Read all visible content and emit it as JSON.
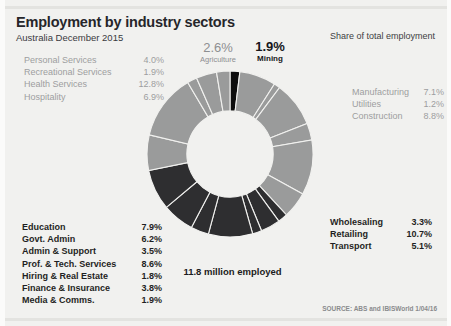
{
  "header": {
    "title": "Employment by industry sectors",
    "subtitle": "Australia December 2015",
    "share_header": "Share of total employment"
  },
  "labels_top_left": [
    {
      "name": "Personal Services",
      "value": "4.0%"
    },
    {
      "name": "Recreational Services",
      "value": "1.9%"
    },
    {
      "name": "Health Services",
      "value": "12.8%"
    },
    {
      "name": "Hospitality",
      "value": "6.9%"
    }
  ],
  "labels_bottom_left": [
    {
      "name": "Education",
      "value": "7.9%"
    },
    {
      "name": "Govt. Admin",
      "value": "6.2%"
    },
    {
      "name": "Admin & Support",
      "value": "3.5%"
    },
    {
      "name": "Prof. & Tech. Services",
      "value": "8.6%"
    },
    {
      "name": "Hiring & Real Estate",
      "value": "1.8%"
    },
    {
      "name": "Finance & Insurance",
      "value": "3.8%"
    },
    {
      "name": "Media & Comms.",
      "value": "1.9%"
    }
  ],
  "labels_right_top": [
    {
      "name": "Manufacturing",
      "value": "7.1%"
    },
    {
      "name": "Utilities",
      "value": "1.2%"
    },
    {
      "name": "Construction",
      "value": "8.8%"
    }
  ],
  "labels_right_bottom": [
    {
      "name": "Wholesaling",
      "value": "3.3%"
    },
    {
      "name": "Retailing",
      "value": "10.7%"
    },
    {
      "name": "Transport",
      "value": "5.1%"
    }
  ],
  "callouts": {
    "agriculture": {
      "value": "2.6%",
      "name": "Agriculture"
    },
    "mining": {
      "value": "1.9%",
      "name": "Mining"
    }
  },
  "center_caption": "11.8 million employed",
  "source": "SOURCE: ABS and IBISWorld 1/04/16",
  "colors": {
    "background": "#f1f1ef",
    "light_grey": "#9a9b9b",
    "dark_grey": "#2e2e30",
    "black": "#0d0d0d",
    "separator": "#f1f1ef",
    "title_text": "#26262a",
    "muted_text": "#9d9ea0"
  },
  "chart_data": {
    "type": "pie",
    "title": "Employment by industry sectors",
    "subtitle": "Australia December 2015",
    "ylabel": "Share of total employment",
    "total_label": "11.8 million employed",
    "donut": true,
    "inner_radius_ratio": 0.52,
    "start_angle_deg": 0,
    "direction": "clockwise",
    "categories": [
      "Mining",
      "Manufacturing",
      "Utilities",
      "Construction",
      "Wholesaling",
      "Retailing",
      "Transport",
      "Media & Comms.",
      "Finance & Insurance",
      "Hiring & Real Estate",
      "Prof. & Tech. Services",
      "Admin & Support",
      "Govt. Admin",
      "Education",
      "Hospitality",
      "Health Services",
      "Recreational Services",
      "Personal Services",
      "Agriculture"
    ],
    "values": [
      1.9,
      7.1,
      1.2,
      8.8,
      3.3,
      10.7,
      5.1,
      1.9,
      3.8,
      1.8,
      8.6,
      3.5,
      6.2,
      7.9,
      6.9,
      12.8,
      1.9,
      4.0,
      2.6
    ],
    "slice_colors": [
      "#0d0d0d",
      "#9a9b9b",
      "#9a9b9b",
      "#9a9b9b",
      "#9a9b9b",
      "#9a9b9b",
      "#9a9b9b",
      "#2e2e30",
      "#2e2e30",
      "#2e2e30",
      "#2e2e30",
      "#2e2e30",
      "#2e2e30",
      "#2e2e30",
      "#9a9b9b",
      "#9a9b9b",
      "#9a9b9b",
      "#9a9b9b",
      "#9a9b9b"
    ],
    "unit": "percent of total employment",
    "legend_position": "around-chart"
  }
}
